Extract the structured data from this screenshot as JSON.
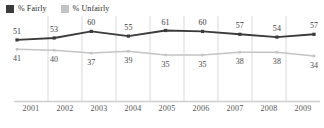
{
  "legend": {
    "items": [
      {
        "label": "% Fairly",
        "color": "#3b3b3b",
        "name": "fairly"
      },
      {
        "label": "% Unfairly",
        "color": "#c4c4c4",
        "name": "unfairly"
      }
    ]
  },
  "chart_data": {
    "type": "line",
    "title": "",
    "subtitle": "",
    "xlabel": "",
    "ylabel": "",
    "grid": "vertical-bands",
    "legend_position": "top-left",
    "categories": [
      "2001",
      "2002",
      "2003",
      "2004",
      "2005",
      "2006",
      "2007",
      "2008",
      "2009"
    ],
    "ylim": [
      0,
      70
    ],
    "series": [
      {
        "name": "% Fairly",
        "color": "#3b3b3b",
        "label_position": "above",
        "values": [
          51,
          53,
          60,
          55,
          61,
          60,
          57,
          54,
          57
        ]
      },
      {
        "name": "% Unfairly",
        "color": "#c4c4c4",
        "label_position": "below",
        "values": [
          41,
          40,
          37,
          39,
          35,
          35,
          38,
          38,
          34
        ]
      }
    ]
  },
  "axis": {
    "ticks": [
      "2001",
      "2002",
      "2003",
      "2004",
      "2005",
      "2006",
      "2007",
      "2008",
      "2009"
    ]
  },
  "colors": {
    "fairly": "#3b3b3b",
    "unfairly": "#c4c4c4",
    "gridline": "#d9d9d9",
    "baseline": "#cfcfcf",
    "text": "#3a3a3a",
    "background": "#ffffff"
  }
}
